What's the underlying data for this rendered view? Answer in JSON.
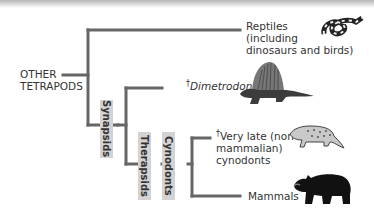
{
  "diagram": {
    "type": "phylogenetic-tree",
    "root_label": [
      "OTHER",
      "TETRAPODS"
    ],
    "branch_labels": {
      "synapsids": "Synapsids",
      "therapsids": "Therapsids",
      "cynodonts": "Cynodonts"
    },
    "taxa": [
      {
        "name": "Reptiles",
        "lines": [
          "Reptiles",
          "(including",
          "dinosaurs and birds)"
        ],
        "extinct": false,
        "icon": "snake-icon"
      },
      {
        "name": "Dimetrodon",
        "lines": [
          "Dimetrodon"
        ],
        "extinct": true,
        "italic": true,
        "icon": "dimetrodon-icon"
      },
      {
        "name": "Very late (non-mammalian) cynodonts",
        "lines": [
          "Very late (non-",
          "mammalian)",
          "cynodonts"
        ],
        "extinct": true,
        "icon": "cynodont-icon"
      },
      {
        "name": "Mammals",
        "lines": [
          "Mammals"
        ],
        "extinct": false,
        "icon": "bear-icon"
      }
    ],
    "extinct_marker": "†",
    "colors": {
      "branch": "#666666",
      "label_bg": "#d3d3d3",
      "text": "#333333"
    }
  }
}
